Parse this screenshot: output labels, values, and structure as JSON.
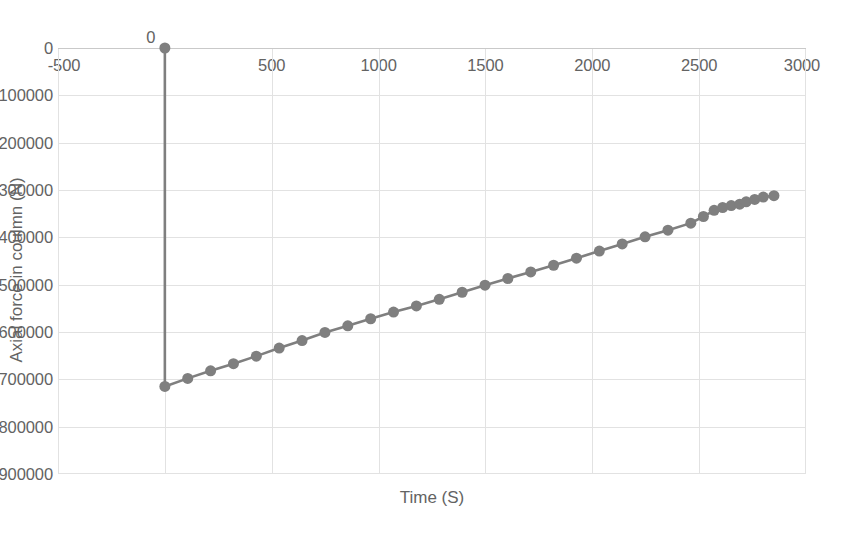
{
  "chart_data": {
    "type": "scatter",
    "title": "",
    "xlabel": "Time (S)",
    "ylabel": "Axial force in coulmn (N)",
    "xlim": [
      -500,
      3000
    ],
    "ylim": [
      -900000,
      0
    ],
    "xticks": [
      -500,
      0,
      500,
      1000,
      1500,
      2000,
      2500,
      3000
    ],
    "yticks": [
      0,
      -100000,
      -200000,
      -300000,
      -400000,
      -500000,
      -600000,
      -700000,
      -800000,
      -900000
    ],
    "xtick_labels": [
      "-500",
      "0",
      "500",
      "1000",
      "1500",
      "2000",
      "2500",
      "3000"
    ],
    "ytick_labels": [
      "0",
      "-100000",
      "-200000",
      "-300000",
      "-400000",
      "-500000",
      "-600000",
      "-700000",
      "-800000",
      "-900000"
    ],
    "grid": true,
    "legend": false,
    "marker": "circle",
    "marker_size": 11,
    "series_color": "#7f7f7f",
    "gridline_color": "#e2e2e2",
    "axis_text_color": "#636363",
    "background_color": "#ffffff",
    "series": [
      {
        "name": "Axial force in coulmn",
        "x": [
          0,
          0,
          107,
          214,
          321,
          428,
          535,
          642,
          749,
          856,
          963,
          1070,
          1177,
          1284,
          1391,
          1498,
          1605,
          1712,
          1819,
          1926,
          2033,
          2140,
          2247,
          2354,
          2461,
          2520,
          2570,
          2610,
          2650,
          2690,
          2720,
          2760,
          2800,
          2850
        ],
        "y": [
          0,
          -715000,
          -698000,
          -682000,
          -667000,
          -651000,
          -634000,
          -618000,
          -601000,
          -587000,
          -572000,
          -558000,
          -545000,
          -531000,
          -516000,
          -501000,
          -487000,
          -473000,
          -459000,
          -444000,
          -429000,
          -414000,
          -399000,
          -385000,
          -370000,
          -356000,
          -343000,
          -337000,
          -333000,
          -330000,
          -325000,
          -320000,
          -315000,
          -312000
        ]
      }
    ]
  }
}
